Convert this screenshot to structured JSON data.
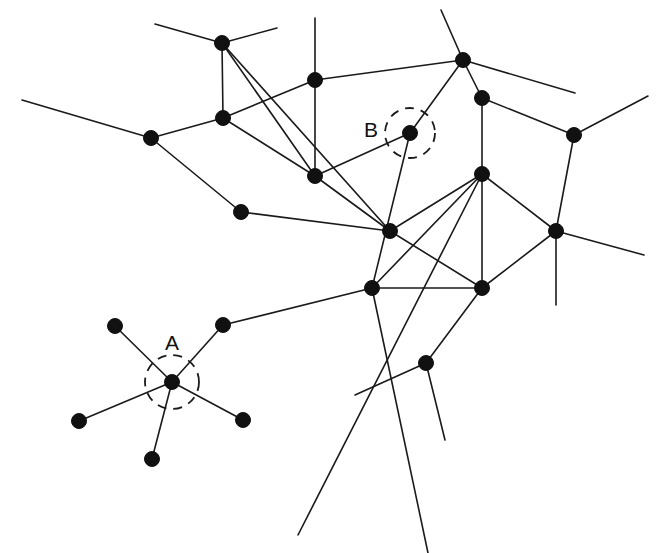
{
  "figure": {
    "type": "node-link-diagram",
    "width": 657,
    "height": 553,
    "background_color": "#ffffff",
    "edge_color": "#1a1a1a",
    "node_color": "#111111",
    "node_radius": 7.5,
    "edge_width": 1.6
  },
  "labels": [
    {
      "text": "A",
      "x": 172,
      "y": 344
    },
    {
      "text": "B",
      "x": 371,
      "y": 131
    }
  ],
  "highlights": [
    {
      "label": "A",
      "cx": 172,
      "cy": 382,
      "r": 27,
      "style": "dashed-circle"
    },
    {
      "label": "B",
      "cx": 410,
      "cy": 133,
      "r": 25,
      "style": "dashed-circle"
    }
  ],
  "chart_data": {
    "type": "scatter",
    "xlabel": "",
    "ylabel": "",
    "nodes": [
      {
        "id": "n1",
        "x": 222,
        "y": 43
      },
      {
        "id": "n2",
        "x": 315,
        "y": 80
      },
      {
        "id": "n3",
        "x": 463,
        "y": 60
      },
      {
        "id": "n4",
        "x": 482,
        "y": 98
      },
      {
        "id": "n5",
        "x": 151,
        "y": 138
      },
      {
        "id": "n6",
        "x": 223,
        "y": 118
      },
      {
        "id": "B",
        "x": 410,
        "y": 133
      },
      {
        "id": "n8",
        "x": 574,
        "y": 135
      },
      {
        "id": "n9",
        "x": 315,
        "y": 176
      },
      {
        "id": "n10",
        "x": 482,
        "y": 174
      },
      {
        "id": "n11",
        "x": 241,
        "y": 212
      },
      {
        "id": "n12",
        "x": 390,
        "y": 231
      },
      {
        "id": "n13",
        "x": 556,
        "y": 231
      },
      {
        "id": "n14",
        "x": 372,
        "y": 288
      },
      {
        "id": "n15",
        "x": 482,
        "y": 288
      },
      {
        "id": "n16",
        "x": 223,
        "y": 325
      },
      {
        "id": "n17",
        "x": 426,
        "y": 363
      },
      {
        "id": "n18",
        "x": 115,
        "y": 326
      },
      {
        "id": "A",
        "x": 172,
        "y": 382
      },
      {
        "id": "n20",
        "x": 79,
        "y": 421
      },
      {
        "id": "n21",
        "x": 243,
        "y": 420
      },
      {
        "id": "n22",
        "x": 152,
        "y": 459
      }
    ],
    "edges": [
      {
        "from": "n1",
        "to": "n9"
      },
      {
        "from": "n1",
        "to": "n6"
      },
      {
        "from": "n1",
        "to": "n12"
      },
      {
        "from": "n2",
        "to": "n9"
      },
      {
        "from": "n2",
        "to": "n3"
      },
      {
        "from": "n2",
        "to": "n6"
      },
      {
        "from": "n3",
        "to": "n4"
      },
      {
        "from": "n3",
        "to": "B"
      },
      {
        "from": "n4",
        "to": "n10"
      },
      {
        "from": "n4",
        "to": "n8"
      },
      {
        "from": "n5",
        "to": "n6"
      },
      {
        "from": "n5",
        "to": "n11"
      },
      {
        "from": "n6",
        "to": "n9"
      },
      {
        "from": "B",
        "to": "n9"
      },
      {
        "from": "B",
        "to": "n14"
      },
      {
        "from": "n8",
        "to": "n13"
      },
      {
        "from": "n9",
        "to": "n12"
      },
      {
        "from": "n10",
        "to": "n12"
      },
      {
        "from": "n10",
        "to": "n13"
      },
      {
        "from": "n10",
        "to": "n14"
      },
      {
        "from": "n10",
        "to": "n15"
      },
      {
        "from": "n11",
        "to": "n12"
      },
      {
        "from": "n12",
        "to": "n15"
      },
      {
        "from": "n13",
        "to": "n15"
      },
      {
        "from": "n14",
        "to": "n15"
      },
      {
        "from": "n14",
        "to": "n16"
      },
      {
        "from": "n16",
        "to": "A"
      },
      {
        "from": "A",
        "to": "n18"
      },
      {
        "from": "A",
        "to": "n20"
      },
      {
        "from": "A",
        "to": "n21"
      },
      {
        "from": "A",
        "to": "n22"
      },
      {
        "from": "n15",
        "to": "n17"
      }
    ],
    "open_edges": [
      {
        "from": "n1",
        "x": 155,
        "y": 24
      },
      {
        "from": "n1",
        "x": 277,
        "y": 28
      },
      {
        "from": "n5",
        "x": 22,
        "y": 100
      },
      {
        "from": "n2",
        "x": 315,
        "y": 18
      },
      {
        "from": "n3",
        "x": 441,
        "y": 10
      },
      {
        "from": "n3",
        "x": 575,
        "y": 93
      },
      {
        "from": "n8",
        "x": 648,
        "y": 96
      },
      {
        "from": "n13",
        "x": 644,
        "y": 255
      },
      {
        "from": "n13",
        "x": 556,
        "y": 305
      },
      {
        "from": "n10",
        "x": 298,
        "y": 535
      },
      {
        "from": "n14",
        "x": 428,
        "y": 553
      },
      {
        "from": "n17",
        "x": 355,
        "y": 395
      },
      {
        "from": "n17",
        "x": 445,
        "y": 440
      }
    ]
  }
}
